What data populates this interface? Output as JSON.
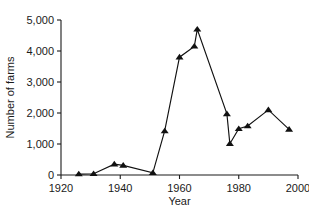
{
  "chart_data": {
    "type": "line",
    "title": "",
    "xlabel": "Year",
    "ylabel": "Number of  farms",
    "xlim": [
      1920,
      2000
    ],
    "ylim": [
      0,
      5000
    ],
    "xticks": [
      1920,
      1940,
      1960,
      1980,
      2000
    ],
    "xtick_labels": [
      "1920",
      "1940",
      "1960",
      "1980",
      "2000"
    ],
    "yticks": [
      0,
      1000,
      2000,
      3000,
      4000,
      5000
    ],
    "ytick_labels": [
      "0",
      "1,000",
      "2,000",
      "3,000",
      "4,000",
      "5,000"
    ],
    "grid": false,
    "legend": "none",
    "marker": "triangle-up",
    "marker_color": "#111111",
    "line_color": "#111111",
    "x": [
      1926,
      1931,
      1938,
      1941,
      1951,
      1955,
      1960,
      1965,
      1966,
      1976,
      1977,
      1980,
      1983,
      1990,
      1997
    ],
    "y": [
      30,
      40,
      350,
      310,
      70,
      1420,
      3800,
      4150,
      4700,
      1970,
      1010,
      1490,
      1580,
      2100,
      1470
    ],
    "points": [
      {
        "year": 1926,
        "farms": 30
      },
      {
        "year": 1931,
        "farms": 40
      },
      {
        "year": 1938,
        "farms": 350
      },
      {
        "year": 1941,
        "farms": 310
      },
      {
        "year": 1951,
        "farms": 70
      },
      {
        "year": 1955,
        "farms": 1420
      },
      {
        "year": 1960,
        "farms": 3800
      },
      {
        "year": 1965,
        "farms": 4150
      },
      {
        "year": 1966,
        "farms": 4700
      },
      {
        "year": 1976,
        "farms": 1970
      },
      {
        "year": 1977,
        "farms": 1010
      },
      {
        "year": 1980,
        "farms": 1490
      },
      {
        "year": 1983,
        "farms": 1580
      },
      {
        "year": 1990,
        "farms": 2100
      },
      {
        "year": 1997,
        "farms": 1470
      }
    ]
  }
}
